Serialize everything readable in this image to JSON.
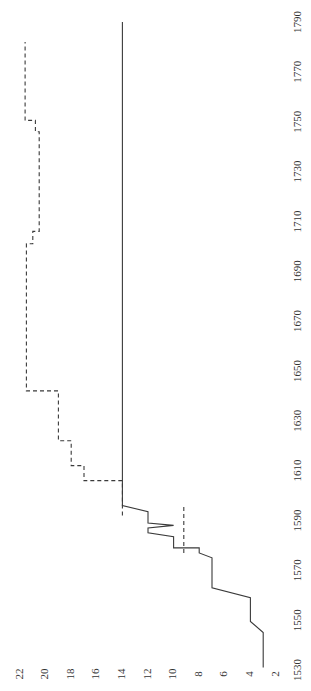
{
  "chart_data": {
    "type": "line",
    "orientation": "rotated-90-clockwise",
    "title": "",
    "xlabel": "",
    "ylabel": "",
    "x_ticks": [
      1530,
      1550,
      1570,
      1590,
      1610,
      1630,
      1650,
      1670,
      1690,
      1710,
      1730,
      1750,
      1770,
      1790
    ],
    "y_ticks": [
      2,
      4,
      6,
      8,
      10,
      12,
      14,
      16,
      18,
      20,
      22
    ],
    "xlim": [
      1530,
      1790
    ],
    "ylim": [
      2,
      22
    ],
    "grid": false,
    "legend": null,
    "series": [
      {
        "name": "solid",
        "style": "solid",
        "points": [
          [
            1531,
            3
          ],
          [
            1545,
            3
          ],
          [
            1549.5,
            4
          ],
          [
            1559,
            4
          ],
          [
            1563,
            7
          ],
          [
            1574,
            7
          ],
          [
            1575,
            7
          ],
          [
            1577,
            8
          ],
          [
            1579,
            8
          ],
          [
            1579,
            10
          ],
          [
            1583.5,
            10
          ],
          [
            1585,
            12
          ],
          [
            1587,
            12
          ],
          [
            1588,
            10
          ],
          [
            1589,
            12
          ],
          [
            1593.5,
            12
          ],
          [
            1596,
            14
          ],
          [
            1790,
            14
          ]
        ]
      },
      {
        "name": "dashed",
        "style": "dashed",
        "points": [
          [
            1592,
            14
          ],
          [
            1606,
            14
          ],
          [
            1606,
            17
          ],
          [
            1612,
            17
          ],
          [
            1612,
            18
          ],
          [
            1622,
            18
          ],
          [
            1622,
            19
          ],
          [
            1642,
            19
          ],
          [
            1642,
            21.5
          ],
          [
            1701,
            21.5
          ],
          [
            1701,
            21
          ],
          [
            1706,
            21
          ],
          [
            1706,
            20.5
          ],
          [
            1746,
            20.5
          ],
          [
            1746,
            20.8
          ],
          [
            1750.5,
            20.8
          ],
          [
            1750.5,
            21.6
          ],
          [
            1782,
            21.6
          ]
        ]
      },
      {
        "name": "dashed-short",
        "style": "dashed",
        "points": [
          [
            1577,
            9.2
          ],
          [
            1596,
            9.2
          ]
        ]
      }
    ]
  },
  "labels": {
    "x_ticks": [
      "1530",
      "1550",
      "1570",
      "1590",
      "1610",
      "1630",
      "1650",
      "1670",
      "1690",
      "1710",
      "1730",
      "1750",
      "1770",
      "1790"
    ],
    "y_ticks": [
      "2",
      "4",
      "6",
      "8",
      "10",
      "12",
      "14",
      "16",
      "18",
      "20",
      "22"
    ]
  }
}
